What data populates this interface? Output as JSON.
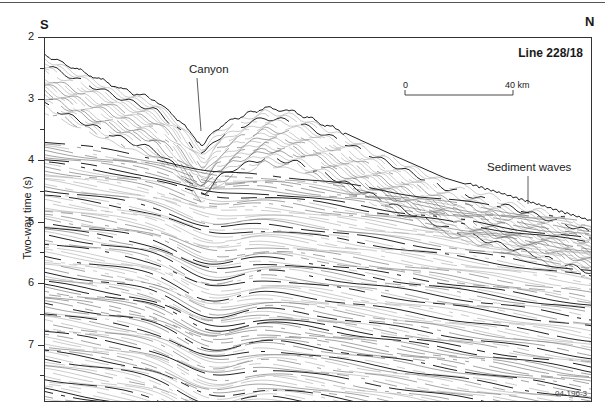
{
  "figure": {
    "left_direction": "S",
    "right_direction": "N",
    "title": "Line 228/18",
    "y_axis": {
      "label": "Two-way time (s)",
      "range": [
        2,
        8
      ],
      "major_ticks": [
        "2",
        "3",
        "4",
        "5",
        "6",
        "7"
      ],
      "minor_ticks_at": [
        2.5,
        3.5,
        4.5,
        5.5,
        6.5,
        7.5
      ]
    },
    "scale_bar": {
      "start_label": "0",
      "end_label": "40 km"
    },
    "annotations": {
      "canyon": "Canyon",
      "sediment_waves": "Sediment waves"
    },
    "figure_id": "04-196-3"
  }
}
